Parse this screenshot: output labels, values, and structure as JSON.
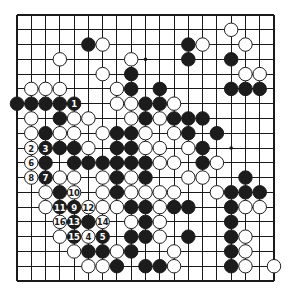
{
  "diagram": {
    "type": "go-board",
    "size": 19,
    "colors": {
      "black": "#1c1c1c",
      "white": "#ffffff",
      "line": "#1a1a1a",
      "background": "#ffffff"
    },
    "star_points": [
      [
        3,
        3
      ],
      [
        3,
        9
      ],
      [
        3,
        15
      ],
      [
        9,
        3
      ],
      [
        9,
        9
      ],
      [
        9,
        15
      ],
      [
        15,
        3
      ],
      [
        15,
        9
      ],
      [
        15,
        15
      ]
    ],
    "stones": [
      {
        "r": 1,
        "c": 15,
        "color": "white"
      },
      {
        "r": 2,
        "c": 5,
        "color": "black"
      },
      {
        "r": 2,
        "c": 6,
        "color": "white"
      },
      {
        "r": 2,
        "c": 12,
        "color": "black"
      },
      {
        "r": 2,
        "c": 13,
        "color": "white"
      },
      {
        "r": 2,
        "c": 16,
        "color": "white"
      },
      {
        "r": 3,
        "c": 3,
        "color": "white"
      },
      {
        "r": 3,
        "c": 8,
        "color": "white"
      },
      {
        "r": 3,
        "c": 12,
        "color": "black"
      },
      {
        "r": 3,
        "c": 15,
        "color": "black"
      },
      {
        "r": 4,
        "c": 6,
        "color": "white"
      },
      {
        "r": 4,
        "c": 8,
        "color": "black"
      },
      {
        "r": 4,
        "c": 16,
        "color": "white"
      },
      {
        "r": 4,
        "c": 17,
        "color": "white"
      },
      {
        "r": 5,
        "c": 1,
        "color": "white"
      },
      {
        "r": 5,
        "c": 2,
        "color": "white"
      },
      {
        "r": 5,
        "c": 3,
        "color": "white"
      },
      {
        "r": 5,
        "c": 7,
        "color": "white"
      },
      {
        "r": 5,
        "c": 8,
        "color": "black"
      },
      {
        "r": 5,
        "c": 10,
        "color": "black"
      },
      {
        "r": 5,
        "c": 15,
        "color": "black"
      },
      {
        "r": 5,
        "c": 16,
        "color": "black"
      },
      {
        "r": 5,
        "c": 17,
        "color": "black"
      },
      {
        "r": 6,
        "c": 0,
        "color": "black"
      },
      {
        "r": 6,
        "c": 1,
        "color": "black"
      },
      {
        "r": 6,
        "c": 2,
        "color": "black"
      },
      {
        "r": 6,
        "c": 3,
        "color": "black"
      },
      {
        "r": 6,
        "c": 4,
        "color": "black",
        "label": "1"
      },
      {
        "r": 6,
        "c": 7,
        "color": "white"
      },
      {
        "r": 6,
        "c": 8,
        "color": "white"
      },
      {
        "r": 6,
        "c": 9,
        "color": "black"
      },
      {
        "r": 6,
        "c": 10,
        "color": "black"
      },
      {
        "r": 6,
        "c": 11,
        "color": "white"
      },
      {
        "r": 7,
        "c": 1,
        "color": "white"
      },
      {
        "r": 7,
        "c": 3,
        "color": "black"
      },
      {
        "r": 7,
        "c": 4,
        "color": "white"
      },
      {
        "r": 7,
        "c": 5,
        "color": "white"
      },
      {
        "r": 7,
        "c": 8,
        "color": "white"
      },
      {
        "r": 7,
        "c": 9,
        "color": "black"
      },
      {
        "r": 7,
        "c": 10,
        "color": "white"
      },
      {
        "r": 7,
        "c": 11,
        "color": "black"
      },
      {
        "r": 7,
        "c": 12,
        "color": "black"
      },
      {
        "r": 7,
        "c": 13,
        "color": "black"
      },
      {
        "r": 8,
        "c": 1,
        "color": "white"
      },
      {
        "r": 8,
        "c": 2,
        "color": "black"
      },
      {
        "r": 8,
        "c": 3,
        "color": "white"
      },
      {
        "r": 8,
        "c": 4,
        "color": "white"
      },
      {
        "r": 8,
        "c": 6,
        "color": "white"
      },
      {
        "r": 8,
        "c": 7,
        "color": "black"
      },
      {
        "r": 8,
        "c": 8,
        "color": "black"
      },
      {
        "r": 8,
        "c": 9,
        "color": "white"
      },
      {
        "r": 8,
        "c": 11,
        "color": "white"
      },
      {
        "r": 8,
        "c": 12,
        "color": "black"
      },
      {
        "r": 8,
        "c": 14,
        "color": "black"
      },
      {
        "r": 9,
        "c": 1,
        "color": "white",
        "label": "2"
      },
      {
        "r": 9,
        "c": 2,
        "color": "black",
        "label": "3"
      },
      {
        "r": 9,
        "c": 3,
        "color": "black"
      },
      {
        "r": 9,
        "c": 4,
        "color": "black"
      },
      {
        "r": 9,
        "c": 5,
        "color": "white"
      },
      {
        "r": 9,
        "c": 7,
        "color": "black"
      },
      {
        "r": 9,
        "c": 8,
        "color": "black"
      },
      {
        "r": 9,
        "c": 9,
        "color": "white"
      },
      {
        "r": 9,
        "c": 10,
        "color": "white"
      },
      {
        "r": 9,
        "c": 12,
        "color": "white"
      },
      {
        "r": 9,
        "c": 13,
        "color": "black"
      },
      {
        "r": 10,
        "c": 1,
        "color": "white",
        "label": "6"
      },
      {
        "r": 10,
        "c": 2,
        "color": "black"
      },
      {
        "r": 10,
        "c": 4,
        "color": "black"
      },
      {
        "r": 10,
        "c": 5,
        "color": "black"
      },
      {
        "r": 10,
        "c": 6,
        "color": "black"
      },
      {
        "r": 10,
        "c": 7,
        "color": "black"
      },
      {
        "r": 10,
        "c": 8,
        "color": "black"
      },
      {
        "r": 10,
        "c": 9,
        "color": "black"
      },
      {
        "r": 10,
        "c": 10,
        "color": "white"
      },
      {
        "r": 10,
        "c": 11,
        "color": "white"
      },
      {
        "r": 10,
        "c": 13,
        "color": "black"
      },
      {
        "r": 10,
        "c": 14,
        "color": "white"
      },
      {
        "r": 11,
        "c": 1,
        "color": "white",
        "label": "8"
      },
      {
        "r": 11,
        "c": 2,
        "color": "black",
        "label": "7"
      },
      {
        "r": 11,
        "c": 3,
        "color": "white"
      },
      {
        "r": 11,
        "c": 4,
        "color": "white"
      },
      {
        "r": 11,
        "c": 6,
        "color": "white"
      },
      {
        "r": 11,
        "c": 7,
        "color": "black"
      },
      {
        "r": 11,
        "c": 8,
        "color": "white"
      },
      {
        "r": 11,
        "c": 9,
        "color": "black"
      },
      {
        "r": 11,
        "c": 12,
        "color": "white"
      },
      {
        "r": 11,
        "c": 13,
        "color": "white"
      },
      {
        "r": 11,
        "c": 16,
        "color": "black"
      },
      {
        "r": 12,
        "c": 2,
        "color": "white"
      },
      {
        "r": 12,
        "c": 3,
        "color": "black"
      },
      {
        "r": 12,
        "c": 4,
        "color": "white",
        "label": "10"
      },
      {
        "r": 12,
        "c": 6,
        "color": "white"
      },
      {
        "r": 12,
        "c": 7,
        "color": "black"
      },
      {
        "r": 12,
        "c": 8,
        "color": "white"
      },
      {
        "r": 12,
        "c": 9,
        "color": "white"
      },
      {
        "r": 12,
        "c": 10,
        "color": "white"
      },
      {
        "r": 12,
        "c": 11,
        "color": "white"
      },
      {
        "r": 12,
        "c": 14,
        "color": "white"
      },
      {
        "r": 12,
        "c": 15,
        "color": "black"
      },
      {
        "r": 12,
        "c": 16,
        "color": "black"
      },
      {
        "r": 12,
        "c": 17,
        "color": "black"
      },
      {
        "r": 13,
        "c": 2,
        "color": "white"
      },
      {
        "r": 13,
        "c": 3,
        "color": "black",
        "label": "11"
      },
      {
        "r": 13,
        "c": 4,
        "color": "black",
        "label": "9"
      },
      {
        "r": 13,
        "c": 5,
        "color": "white",
        "label": "12"
      },
      {
        "r": 13,
        "c": 6,
        "color": "white"
      },
      {
        "r": 13,
        "c": 7,
        "color": "white"
      },
      {
        "r": 13,
        "c": 8,
        "color": "black"
      },
      {
        "r": 13,
        "c": 9,
        "color": "black"
      },
      {
        "r": 13,
        "c": 10,
        "color": "white"
      },
      {
        "r": 13,
        "c": 11,
        "color": "black"
      },
      {
        "r": 13,
        "c": 12,
        "color": "black"
      },
      {
        "r": 13,
        "c": 15,
        "color": "black"
      },
      {
        "r": 13,
        "c": 16,
        "color": "white"
      },
      {
        "r": 13,
        "c": 17,
        "color": "white"
      },
      {
        "r": 14,
        "c": 3,
        "color": "white",
        "label": "16"
      },
      {
        "r": 14,
        "c": 4,
        "color": "black",
        "label": "13"
      },
      {
        "r": 14,
        "c": 5,
        "color": "black"
      },
      {
        "r": 14,
        "c": 6,
        "color": "white",
        "label": "14"
      },
      {
        "r": 14,
        "c": 8,
        "color": "white"
      },
      {
        "r": 14,
        "c": 9,
        "color": "black"
      },
      {
        "r": 14,
        "c": 10,
        "color": "white"
      },
      {
        "r": 14,
        "c": 15,
        "color": "black"
      },
      {
        "r": 15,
        "c": 3,
        "color": "white"
      },
      {
        "r": 15,
        "c": 4,
        "color": "black",
        "label": "15"
      },
      {
        "r": 15,
        "c": 5,
        "color": "white",
        "label": "4"
      },
      {
        "r": 15,
        "c": 6,
        "color": "black",
        "label": "5"
      },
      {
        "r": 15,
        "c": 8,
        "color": "black"
      },
      {
        "r": 15,
        "c": 9,
        "color": "black"
      },
      {
        "r": 15,
        "c": 10,
        "color": "white"
      },
      {
        "r": 15,
        "c": 12,
        "color": "black"
      },
      {
        "r": 15,
        "c": 15,
        "color": "black"
      },
      {
        "r": 15,
        "c": 16,
        "color": "white"
      },
      {
        "r": 16,
        "c": 4,
        "color": "white"
      },
      {
        "r": 16,
        "c": 5,
        "color": "black"
      },
      {
        "r": 16,
        "c": 6,
        "color": "black"
      },
      {
        "r": 16,
        "c": 7,
        "color": "white"
      },
      {
        "r": 16,
        "c": 8,
        "color": "black"
      },
      {
        "r": 16,
        "c": 11,
        "color": "white"
      },
      {
        "r": 16,
        "c": 15,
        "color": "black"
      },
      {
        "r": 16,
        "c": 16,
        "color": "white"
      },
      {
        "r": 17,
        "c": 5,
        "color": "white"
      },
      {
        "r": 17,
        "c": 6,
        "color": "white"
      },
      {
        "r": 17,
        "c": 7,
        "color": "black"
      },
      {
        "r": 17,
        "c": 9,
        "color": "black"
      },
      {
        "r": 17,
        "c": 10,
        "color": "black"
      },
      {
        "r": 17,
        "c": 11,
        "color": "white"
      },
      {
        "r": 17,
        "c": 15,
        "color": "black"
      },
      {
        "r": 17,
        "c": 16,
        "color": "white"
      },
      {
        "r": 17,
        "c": 18,
        "color": "white"
      }
    ]
  }
}
